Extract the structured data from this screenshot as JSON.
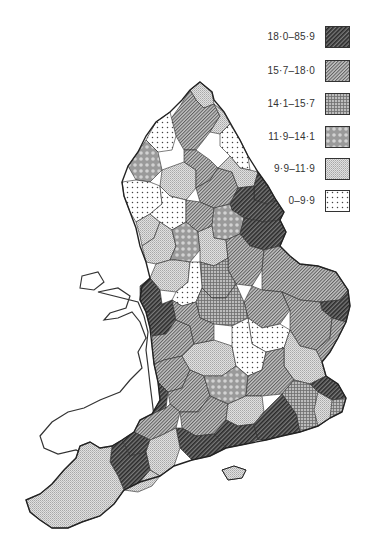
{
  "map": {
    "subject": "England and Wales administrative areas (choropleth)",
    "classes_count": 6,
    "wales_unshaded": true
  },
  "legend": {
    "items": [
      {
        "label": "18·0–85·9",
        "pattern": "dense-diagonal-hatch",
        "fill": "#4a4a4a"
      },
      {
        "label": "15·7–18·0",
        "pattern": "fine-diagonal-hatch",
        "fill": "#8a8a8a"
      },
      {
        "label": "14·1–15·7",
        "pattern": "cross-hatch",
        "fill": "#9d9d9d"
      },
      {
        "label": "11·9–14·1",
        "pattern": "circle-texture",
        "fill": "#aaaaaa"
      },
      {
        "label": "9·9–11·9",
        "pattern": "light-stipple",
        "fill": "#cfcfcf"
      },
      {
        "label": "0–9·9",
        "pattern": "dots",
        "fill": "#ffffff"
      }
    ]
  },
  "regions": [
    {
      "area": "Northumberland north",
      "class": 4
    },
    {
      "area": "Northumberland central",
      "class": 1
    },
    {
      "area": "Tyneside",
      "class": 4
    },
    {
      "area": "Durham coast",
      "class": 5
    },
    {
      "area": "Cumbria north",
      "class": 5
    },
    {
      "area": "Cumbria west",
      "class": 3
    },
    {
      "area": "Cumbria south",
      "class": 4
    },
    {
      "area": "Durham west",
      "class": 1
    },
    {
      "area": "North Yorkshire central",
      "class": 1
    },
    {
      "area": "North Yorkshire east",
      "class": 4
    },
    {
      "area": "Yorkshire coast",
      "class": 0
    },
    {
      "area": "Lancashire",
      "class": 5
    },
    {
      "area": "Merseyside",
      "class": 4
    },
    {
      "area": "Greater Manchester",
      "class": 5
    },
    {
      "area": "West Yorkshire",
      "class": 1
    },
    {
      "area": "Humberside",
      "class": 0
    },
    {
      "area": "South Yorkshire",
      "class": 3
    },
    {
      "area": "Lincolnshire north",
      "class": 0
    },
    {
      "area": "Cheshire",
      "class": 4
    },
    {
      "area": "Derbyshire",
      "class": 3
    },
    {
      "area": "Nottinghamshire",
      "class": 4
    },
    {
      "area": "Lincolnshire south",
      "class": 1
    },
    {
      "area": "Staffordshire",
      "class": 4
    },
    {
      "area": "Shropshire",
      "class": 0
    },
    {
      "area": "Leicestershire",
      "class": 2
    },
    {
      "area": "West Midlands",
      "class": 5
    },
    {
      "area": "Norfolk",
      "class": 1
    },
    {
      "area": "Norfolk east",
      "class": 0
    },
    {
      "area": "Cambridgeshire",
      "class": 1
    },
    {
      "area": "Suffolk",
      "class": 1
    },
    {
      "area": "Suffolk coast",
      "class": 1
    },
    {
      "area": "Welsh borders",
      "class": 0
    },
    {
      "area": "Hereford & Worcester",
      "class": 1
    },
    {
      "area": "Northamptonshire",
      "class": 2
    },
    {
      "area": "Bedfordshire",
      "class": 5
    },
    {
      "area": "Essex",
      "class": 4
    },
    {
      "area": "Essex north",
      "class": 0
    },
    {
      "area": "Gloucestershire",
      "class": 1
    },
    {
      "area": "Oxfordshire",
      "class": 4
    },
    {
      "area": "Buckinghamshire",
      "class": 1
    },
    {
      "area": "Hertfordshire",
      "class": 5
    },
    {
      "area": "Avon",
      "class": 0
    },
    {
      "area": "Wiltshire",
      "class": 1
    },
    {
      "area": "Berkshire",
      "class": 3
    },
    {
      "area": "Greater London",
      "class": 1
    },
    {
      "area": "Kent",
      "class": 2
    },
    {
      "area": "Kent east",
      "class": 4
    },
    {
      "area": "Somerset",
      "class": 1
    },
    {
      "area": "Somerset north",
      "class": 0
    },
    {
      "area": "Hampshire",
      "class": 1
    },
    {
      "area": "Surrey",
      "class": 4
    },
    {
      "area": "Sussex west",
      "class": 0
    },
    {
      "area": "Sussex east",
      "class": 0
    },
    {
      "area": "Dorset",
      "class": 0
    },
    {
      "area": "Dorset west",
      "class": 4
    },
    {
      "area": "Devon",
      "class": 0
    },
    {
      "area": "Devon east",
      "class": 4
    },
    {
      "area": "Cornwall",
      "class": 4
    },
    {
      "area": "Isle of Wight",
      "class": 0
    }
  ]
}
